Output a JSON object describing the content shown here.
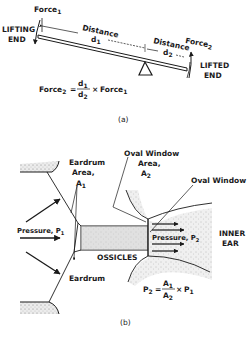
{
  "figure": {
    "part_a": {
      "caption": "(a)",
      "labels": {
        "force1": "Force",
        "force1_sub": "1",
        "lifting_end_line1": "LIFTING",
        "lifting_end_line2": "END",
        "distance1": "Distance",
        "d1": "d",
        "d1_sub": "1",
        "distance2": "Distance",
        "d2": "d",
        "d2_sub": "2",
        "force2": "Force",
        "force2_sub": "2",
        "lifted_end_line1": "LIFTED",
        "lifted_end_line2": "END"
      },
      "formula": {
        "lhs": "Force",
        "lhs_sub": "2",
        "equals": "=",
        "num": "d",
        "num_sub": "1",
        "den": "d",
        "den_sub": "2",
        "times": "×",
        "rhs": "Force",
        "rhs_sub": "1"
      }
    },
    "part_b": {
      "caption": "(b)",
      "labels": {
        "eardrum_area_line1": "Eardrum",
        "eardrum_area_line2": "Area,",
        "a1": "A",
        "a1_sub": "1",
        "oval_window_area_line1": "Oval Window",
        "oval_window_area_line2": "Area,",
        "a2": "A",
        "a2_sub": "2",
        "oval_window": "Oval Window",
        "pressure1": "Pressure,  P",
        "pressure1_sub": "1",
        "pressure2": "Pressure,  P",
        "pressure2_sub": "2",
        "inner_ear_line1": "INNER",
        "inner_ear_line2": "EAR",
        "ossicles": "OSSICLES",
        "eardrum": "Eardrum"
      },
      "formula": {
        "lhs": "P",
        "lhs_sub": "2",
        "equals": "=",
        "num": "A",
        "num_sub": "1",
        "den": "A",
        "den_sub": "2",
        "times": "×",
        "rhs": "P",
        "rhs_sub": "1"
      }
    },
    "colors": {
      "ink": "#1a1a1a",
      "stipple_fill": "#d8d8d8",
      "ossicles_fill": "#cfcfcf",
      "background": "#ffffff"
    }
  }
}
